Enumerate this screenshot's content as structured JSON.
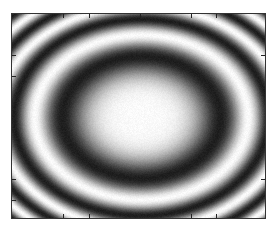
{
  "image": {
    "description": "Grayscale concentric elliptical interference rings",
    "width": 276,
    "height": 229
  },
  "plot": {
    "frame": {
      "left": 11,
      "top": 13,
      "width": 255,
      "height": 206,
      "border_color": "#333333"
    },
    "pattern": {
      "type": "concentric-elliptical-rings",
      "center_x": 129,
      "center_y": 103,
      "first_dark_radius_x": 79,
      "first_dark_radius_y": 61,
      "phase_exponent": 2.3,
      "min_gray": 30,
      "max_gray": 250
    },
    "ticks": {
      "top_x": [
        51,
        77,
        128,
        179,
        204
      ],
      "bottom_x": [
        51,
        77,
        128,
        179,
        204
      ],
      "left_y": [
        41,
        62,
        165,
        186
      ],
      "right_y": [
        41,
        165
      ]
    }
  }
}
